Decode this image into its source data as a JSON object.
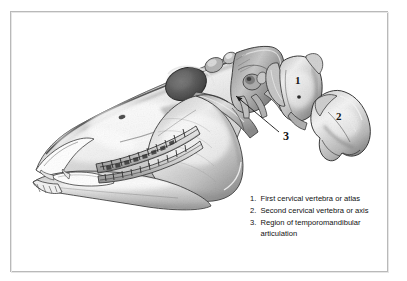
{
  "figure": {
    "background_color": "#ffffff",
    "frame_color": "#b9b9b9",
    "ink_color": "#141414"
  },
  "callouts": [
    {
      "id": "callout-1",
      "label": "1",
      "refers_to": "First cervical vertebra or atlas"
    },
    {
      "id": "callout-2",
      "label": "2",
      "refers_to": "Second cervical vertebra or axis"
    },
    {
      "id": "callout-3",
      "label": "3",
      "refers_to": "Region of temporomandibular articulation"
    }
  ],
  "legend": {
    "items": [
      {
        "number": "1.",
        "text": "First cervical vertebra or atlas"
      },
      {
        "number": "2.",
        "text": "Second cervical vertebra or axis"
      },
      {
        "number": "3.",
        "text": "Region of temporomandibular articulation"
      }
    ]
  },
  "illustration": {
    "style": "graphite pencil shaded anatomical drawing",
    "subject": "equine skull, lateral view, facing left",
    "parts": [
      "cranium",
      "nasal bone",
      "orbit",
      "zygomatic arch",
      "maxilla with cheek teeth",
      "mandible with cheek teeth",
      "incisors",
      "occipital region",
      "atlas vertebra",
      "axis vertebra"
    ],
    "leader_line": {
      "from": "3",
      "to": "temporomandibular joint"
    }
  }
}
